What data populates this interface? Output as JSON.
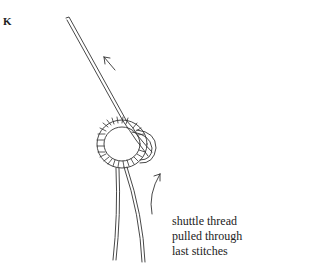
{
  "figure": {
    "label": "K",
    "caption_lines": [
      "shuttle thread",
      "pulled through",
      "last stitches"
    ],
    "elements": {
      "needle": "tatting-needle",
      "ring": "stitch-ring",
      "arrows": [
        "arrow-up-left",
        "arrow-curved-up"
      ],
      "threads": [
        "thread-left",
        "thread-right"
      ]
    },
    "colors": {
      "ink": "#333333",
      "background": "#ffffff"
    }
  }
}
